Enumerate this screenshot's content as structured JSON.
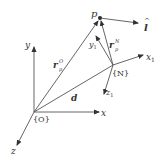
{
  "diagram": {
    "type": "coordinate-frames",
    "line_color": "#444444",
    "labels": {
      "x": "x",
      "y": "y",
      "z": "z",
      "origin": "{O}",
      "frame_n": "{N}",
      "x1": "x",
      "x1_sub": "1",
      "y1": "y",
      "y1_sub": "1",
      "z1": "z",
      "z1_sub": "1",
      "point": "p",
      "d": "d",
      "r_o": "r",
      "r_o_sup": "O",
      "r_o_sub": "p",
      "r_n": "r",
      "r_n_sup": "N",
      "r_n_sub": "p",
      "l_hat": "l",
      "l_hat_accent": "^"
    }
  }
}
